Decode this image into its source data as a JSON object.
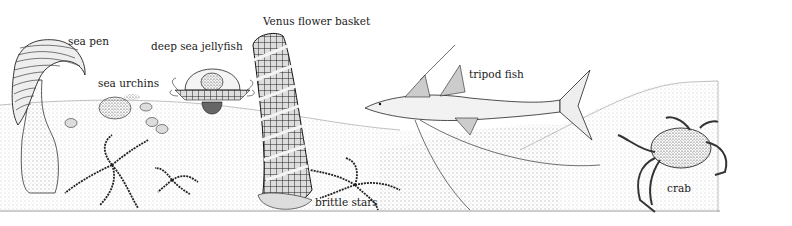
{
  "diagram": {
    "type": "illustration",
    "labels": [
      {
        "id": "sea_pen",
        "text": "sea pen",
        "x": 68,
        "y": 35
      },
      {
        "id": "deep_sea_jellyfish",
        "text": "deep sea jellyfish",
        "x": 151,
        "y": 40
      },
      {
        "id": "sea_urchins",
        "text": "sea urchins",
        "x": 98,
        "y": 77
      },
      {
        "id": "venus_flower_basket",
        "text": "Venus flower basket",
        "x": 263,
        "y": 15
      },
      {
        "id": "tripod_fish",
        "text": "tripod fish",
        "x": 469,
        "y": 68
      },
      {
        "id": "brittle_stars",
        "text": "brittle stars",
        "x": 315,
        "y": 196
      },
      {
        "id": "crab",
        "text": "crab",
        "x": 667,
        "y": 182
      }
    ]
  }
}
